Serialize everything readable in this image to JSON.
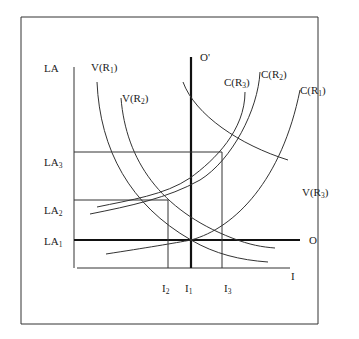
{
  "diagram": {
    "type": "economics-curve-diagram",
    "axes": {
      "y_label": "LA",
      "x_label": "I"
    },
    "y_levels": [
      {
        "id": "LA1",
        "base": "LA",
        "sub": "1"
      },
      {
        "id": "LA2",
        "base": "LA",
        "sub": "2"
      },
      {
        "id": "LA3",
        "base": "LA",
        "sub": "3"
      }
    ],
    "x_levels": [
      {
        "id": "I2",
        "base": "I",
        "sub": "2"
      },
      {
        "id": "I1",
        "base": "I",
        "sub": "1"
      },
      {
        "id": "I3",
        "base": "I",
        "sub": "3"
      }
    ],
    "lines": {
      "horizontal": {
        "label": "O"
      },
      "vertical": {
        "label": "O'"
      }
    },
    "curves": {
      "V": [
        {
          "id": "V(R1)",
          "base": "V(R",
          "sub": "1",
          "close": ")"
        },
        {
          "id": "V(R2)",
          "base": "V(R",
          "sub": "2",
          "close": ")"
        },
        {
          "id": "V(R3)",
          "base": "V(R",
          "sub": "3",
          "close": ")"
        }
      ],
      "C": [
        {
          "id": "C(R3)",
          "base": "C(R",
          "sub": "3",
          "close": ")"
        },
        {
          "id": "C(R2)",
          "base": "C(R",
          "sub": "2",
          "close": ")"
        },
        {
          "id": "C(R1)",
          "base": "C(R",
          "sub": "1",
          "close": ")"
        }
      ]
    }
  }
}
